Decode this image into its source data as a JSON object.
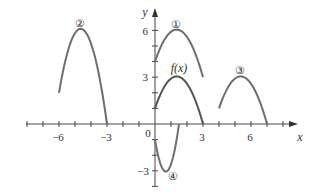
{
  "chart_data": {
    "type": "line",
    "title": "",
    "xlabel": "x",
    "ylabel": "y",
    "xlim": [
      -8,
      9
    ],
    "ylim": [
      -4.5,
      7.5
    ],
    "x_ticks": [
      -6,
      -3,
      0,
      3,
      6
    ],
    "y_ticks": [
      -3,
      3,
      6
    ],
    "x_tick_labels": [
      "−6",
      "−3",
      "0",
      "3",
      "6"
    ],
    "y_tick_labels": [
      "−3",
      "3",
      "6"
    ],
    "grid": false,
    "series": [
      {
        "name": "f(x)",
        "label": "f(x)",
        "x": [
          0,
          0.5,
          1,
          1.35,
          2,
          2.5,
          3
        ],
        "y": [
          1,
          2.24,
          2.91,
          3.0,
          2.58,
          1.57,
          0
        ]
      },
      {
        "name": "curve-1",
        "label": "①",
        "x": [
          0,
          0.5,
          1,
          1.35,
          2,
          2.5,
          3
        ],
        "y": [
          4,
          5.24,
          5.91,
          6.0,
          5.58,
          4.57,
          3
        ]
      },
      {
        "name": "curve-2",
        "label": "②",
        "x": [
          -6,
          -5.5,
          -5,
          -4.65,
          -4,
          -3.5,
          -3
        ],
        "y": [
          2,
          4.48,
          5.82,
          6.0,
          5.16,
          3.14,
          0
        ]
      },
      {
        "name": "curve-3",
        "label": "③",
        "x": [
          4,
          4.5,
          5,
          5.35,
          6,
          6.5,
          7
        ],
        "y": [
          1,
          2.24,
          2.91,
          3.0,
          2.58,
          1.57,
          0
        ]
      },
      {
        "name": "curve-4",
        "label": "④",
        "x": [
          0,
          0.25,
          0.5,
          0.675,
          1,
          1.25,
          1.5
        ],
        "y": [
          -1,
          -2.24,
          -2.91,
          -3.0,
          -2.58,
          -1.57,
          0
        ]
      }
    ]
  },
  "labels": {
    "x_axis": "x",
    "y_axis": "y",
    "origin": "0",
    "fx": "f(x)",
    "c1": "①",
    "c2": "②",
    "c3": "③",
    "c4": "④"
  },
  "colors": {
    "curve": "#6e6e6e",
    "axis": "#333333"
  }
}
